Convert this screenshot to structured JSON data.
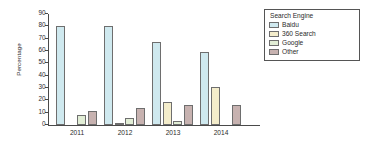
{
  "chart_data": {
    "type": "bar",
    "title": "",
    "xlabel": "",
    "ylabel": "Percentage",
    "ylim": [
      0,
      90
    ],
    "ytick_step": 10,
    "yticks": [
      0,
      10,
      20,
      30,
      40,
      50,
      60,
      70,
      80,
      90
    ],
    "grid": false,
    "legend_position": "top-right",
    "legend_title": "Search Engine",
    "categories": [
      "2011",
      "2012",
      "2013",
      "2014"
    ],
    "series": [
      {
        "name": "Baidu",
        "color": "#cfe9ef",
        "values": [
          80.0,
          80.5,
          67.5,
          59.0
        ]
      },
      {
        "name": "360 Search",
        "color": "#f4edcb",
        "values": [
          0,
          2.0,
          19.0,
          30.5
        ]
      },
      {
        "name": "Google",
        "color": "#e2eed6",
        "values": [
          8.0,
          5.5,
          3.0,
          0
        ]
      },
      {
        "name": "Other",
        "color": "#c7b2b0",
        "values": [
          11.5,
          14.0,
          16.5,
          16.5
        ]
      }
    ]
  }
}
